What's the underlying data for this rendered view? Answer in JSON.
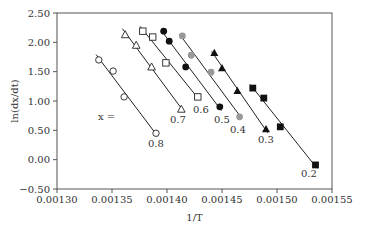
{
  "chart_data": {
    "type": "scatter",
    "title": "",
    "xlabel": "1/T",
    "ylabel": "ln(dx/dt)",
    "xlim": [
      0.0013,
      0.00155
    ],
    "ylim": [
      -0.5,
      2.5
    ],
    "xticks": [
      "0.00130",
      "0.00135",
      "0.00140",
      "0.00145",
      "0.00150",
      "0.00155"
    ],
    "yticks": [
      "2.50",
      "2.00",
      "1.50",
      "1.00",
      "0.50",
      "0.00",
      "−0.50"
    ],
    "grid": false,
    "legend": "inline labels",
    "annotation": "x =",
    "series": [
      {
        "name": "0.8",
        "marker": "open-circle",
        "x": [
          0.001338,
          0.001351,
          0.001361,
          0.00139
        ],
        "y": [
          1.7,
          1.51,
          1.07,
          0.45
        ]
      },
      {
        "name": "0.7",
        "marker": "open-triangle",
        "x": [
          0.001362,
          0.001372,
          0.001386,
          0.001413
        ],
        "y": [
          2.13,
          1.95,
          1.58,
          0.86
        ]
      },
      {
        "name": "0.6",
        "marker": "open-square",
        "x": [
          0.001378,
          0.001387,
          0.001399,
          0.001428
        ],
        "y": [
          2.19,
          2.09,
          1.65,
          1.07
        ]
      },
      {
        "name": "0.5",
        "marker": "filled-circle",
        "x": [
          0.001397,
          0.001402,
          0.001417,
          0.001448
        ],
        "y": [
          2.19,
          2.02,
          1.58,
          0.9
        ]
      },
      {
        "name": "0.4",
        "marker": "gray-circle",
        "x": [
          0.001414,
          0.001422,
          0.00144,
          0.001466
        ],
        "y": [
          2.11,
          1.78,
          1.49,
          0.73
        ]
      },
      {
        "name": "0.3",
        "marker": "filled-triangle",
        "x": [
          0.001443,
          0.00145,
          0.001464,
          0.00149
        ],
        "y": [
          1.82,
          1.56,
          1.17,
          0.52
        ]
      },
      {
        "name": "0.2",
        "marker": "filled-square",
        "x": [
          0.001478,
          0.001488,
          0.001503,
          0.001535
        ],
        "y": [
          1.22,
          1.05,
          0.56,
          -0.09
        ]
      }
    ]
  },
  "labels": {
    "x_eq": "x =",
    "s08": "0.8",
    "s07": "0.7",
    "s06": "0.6",
    "s05": "0.5",
    "s04": "0.4",
    "s03": "0.3",
    "s02": "0.2"
  }
}
